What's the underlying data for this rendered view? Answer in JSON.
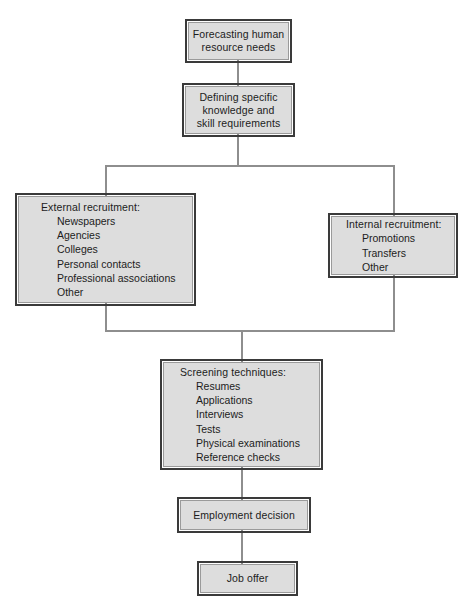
{
  "diagram": {
    "background_color": "#ffffff",
    "box_fill_color": "#dddddd",
    "box_border_color": "#3a3a3a",
    "connector_color": "#8e8e8e",
    "nodes": {
      "forecasting": {
        "label": "Forecasting human\nresource needs"
      },
      "defining": {
        "label": "Defining specific\nknowledge and\nskill requirements"
      },
      "external": {
        "label": "External recruitment:",
        "items": [
          "Newspapers",
          "Agencies",
          "Colleges",
          "Personal contacts",
          "Professional associations",
          "Other"
        ]
      },
      "internal": {
        "label": "Internal recruitment:",
        "items": [
          "Promotions",
          "Transfers",
          "Other"
        ]
      },
      "screening": {
        "label": "Screening techniques:",
        "items": [
          "Resumes",
          "Applications",
          "Interviews",
          "Tests",
          "Physical examinations",
          "Reference checks"
        ]
      },
      "employment": {
        "label": "Employment decision"
      },
      "joboffer": {
        "label": "Job offer"
      }
    }
  }
}
